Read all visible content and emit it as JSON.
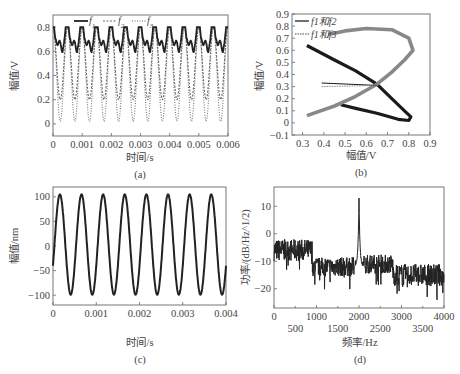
{
  "chart_data": [
    {
      "id": "a",
      "type": "line",
      "caption": "(a)",
      "xlabel": "时间/s",
      "ylabel": "幅值/V",
      "xlim": [
        0,
        0.006
      ],
      "ylim": [
        -0.1,
        0.9
      ],
      "xticks": [
        "0",
        "0.001",
        "0.002",
        "0.003",
        "0.004",
        "0.005",
        "0.006"
      ],
      "yticks": [
        "0",
        "0.2",
        "0.4",
        "0.6",
        "0.8"
      ],
      "legend": [
        "f1",
        "f2",
        "f3"
      ],
      "legend_position": "top",
      "series": [
        {
          "name": "f1",
          "style": "solid",
          "description": "periodic double-peak waveform, peaks ~0.8 V, dips to ~0.7 V and troughs ~0.5 V, period ~0.0005 s",
          "min": 0.5,
          "max": 0.8,
          "period": 0.0005
        },
        {
          "name": "f2",
          "style": "dashed",
          "description": "periodic waveform, max ~0.8 V, troughs ~0.2 V, shoulder ~0.5 V",
          "min": 0.2,
          "max": 0.8,
          "period": 0.0005
        },
        {
          "name": "f3",
          "style": "dotted",
          "description": "periodic waveform, max ~0.8 V, troughs ~0.02 V",
          "min": 0.02,
          "max": 0.8,
          "period": 0.0005
        }
      ]
    },
    {
      "id": "b",
      "type": "scatter",
      "caption": "(b)",
      "xlabel": "幅值/V",
      "ylabel": "幅值/V",
      "xlim": [
        0.25,
        0.9
      ],
      "ylim": [
        -0.1,
        0.9
      ],
      "xticks": [
        "0.3",
        "0.4",
        "0.5",
        "0.6",
        "0.7",
        "0.8",
        "0.9"
      ],
      "yticks": [
        "-0.1",
        "0",
        "0.1",
        "0.2",
        "0.3",
        "0.4",
        "0.5",
        "0.6",
        "0.7",
        "0.8",
        "0.9"
      ],
      "legend": [
        "f1和f2",
        "f1和f3"
      ],
      "legend_position": "upper left",
      "series": [
        {
          "name": "f1和f2",
          "style": "solid",
          "points": [
            [
              0.32,
              0.64
            ],
            [
              0.45,
              0.52
            ],
            [
              0.55,
              0.43
            ],
            [
              0.65,
              0.32
            ],
            [
              0.72,
              0.2
            ],
            [
              0.78,
              0.1
            ],
            [
              0.81,
              0.05
            ],
            [
              0.8,
              0.02
            ],
            [
              0.75,
              0.03
            ],
            [
              0.65,
              0.08
            ],
            [
              0.55,
              0.12
            ],
            [
              0.48,
              0.15
            ]
          ]
        },
        {
          "name": "f1和f3",
          "style": "dotted",
          "points": [
            [
              0.32,
              0.06
            ],
            [
              0.45,
              0.14
            ],
            [
              0.55,
              0.22
            ],
            [
              0.65,
              0.32
            ],
            [
              0.72,
              0.42
            ],
            [
              0.78,
              0.52
            ],
            [
              0.82,
              0.6
            ],
            [
              0.8,
              0.7
            ],
            [
              0.72,
              0.77
            ],
            [
              0.6,
              0.78
            ],
            [
              0.5,
              0.76
            ],
            [
              0.42,
              0.73
            ]
          ]
        },
        {
          "name": "f1和f2-spur",
          "style": "solid",
          "points": [
            [
              0.39,
              0.33
            ],
            [
              0.65,
              0.31
            ]
          ]
        },
        {
          "name": "f1和f3-spur",
          "style": "dotted",
          "points": [
            [
              0.39,
              0.3
            ],
            [
              0.65,
              0.31
            ]
          ]
        }
      ]
    },
    {
      "id": "c",
      "type": "line",
      "caption": "(c)",
      "xlabel": "时间/s",
      "ylabel": "幅值/nm",
      "xlim": [
        0,
        0.004
      ],
      "ylim": [
        -120,
        120
      ],
      "xticks": [
        "0",
        "0.001",
        "0.002",
        "0.003",
        "0.004"
      ],
      "yticks": [
        "-100",
        "-50",
        "0",
        "50",
        "100"
      ],
      "series": [
        {
          "name": "displacement",
          "style": "solid",
          "amplitude": 102,
          "offset": 3,
          "frequency_hz": 2000,
          "phase_start_value": -40
        }
      ]
    },
    {
      "id": "d",
      "type": "line",
      "caption": "(d)",
      "xlabel": "频率/Hz",
      "ylabel": "功率/(dB/Hz^1/2)",
      "ylabel_sup": "1/2",
      "xlim": [
        0,
        4000
      ],
      "ylim": [
        -27,
        17
      ],
      "xticks_top_row": [
        "0",
        "1000",
        "2000",
        "3000",
        "4000"
      ],
      "xticks_bottom_row": [
        "500",
        "1500",
        "2500",
        "3500"
      ],
      "yticks": [
        "-20",
        "-10",
        "0",
        "10"
      ],
      "series": [
        {
          "name": "power spectrum",
          "style": "solid",
          "peak": {
            "x": 2000,
            "y": 13
          },
          "segments": [
            {
              "x": [
                0,
                900
              ],
              "mean": -6,
              "noise": 4
            },
            {
              "x": [
                900,
                1900
              ],
              "mean": -12,
              "noise": 3.5
            },
            {
              "x": [
                2100,
                2800
              ],
              "mean": -11,
              "noise": 3.5
            },
            {
              "x": [
                2800,
                4000
              ],
              "mean": -15,
              "noise": 4
            }
          ]
        }
      ]
    }
  ]
}
